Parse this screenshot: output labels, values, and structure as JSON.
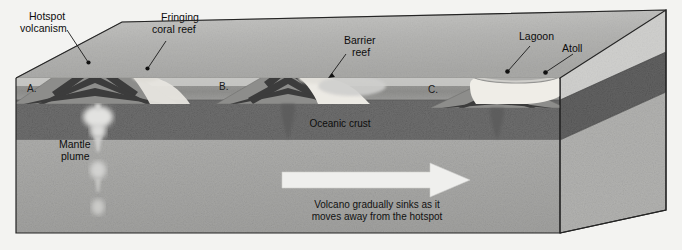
{
  "figure": {
    "kind": "block-diagram"
  },
  "labels": {
    "hotspot_volcanism": "Hotspot\nvolcanism",
    "hotspot_volcanism_l1": "Hotspot",
    "hotspot_volcanism_l2": "volcanism",
    "fringing_reef_l1": "Fringing",
    "fringing_reef_l2": "coral reef",
    "barrier_reef_l1": "Barrier",
    "barrier_reef_l2": "reef",
    "lagoon": "Lagoon",
    "atoll": "Atoll",
    "oceanic_crust": "Oceanic crust",
    "mantle_plume_l1": "Mantle",
    "mantle_plume_l2": "plume",
    "arrow_caption_l1": "Volcano gradually sinks as it",
    "arrow_caption_l2": "moves away from the hotspot"
  },
  "stages": [
    {
      "id": "A",
      "label": "A.",
      "描述": "",
      "description": "Volcanic island with fringing coral reef over the hotspot"
    },
    {
      "id": "B",
      "label": "B.",
      "description": "Subsided volcano with barrier reef and lagoon"
    },
    {
      "id": "C",
      "label": "C.",
      "description": "Fully subsided volcano forming an atoll enclosing a lagoon"
    }
  ],
  "colors": {
    "page_background": "#f3f3f1",
    "sea_water": "#9a9a9a",
    "sea_surface_light": "#d7d7d5",
    "sky_top_face": "#bdbdbb",
    "oceanic_crust": "#6d6d6d",
    "mantle": "#a8a8a6",
    "volcano_dark": "#4a4a4a",
    "volcano_light": "#c9c9c7",
    "reef_light": "#eceae4",
    "plume_light": "#d8d8d6",
    "ash_cloud": "#4d4d4d",
    "arrow_fill": "#efefed",
    "outline": "#2b2b2b"
  },
  "annotations": {
    "arrow_direction": "left-to-right",
    "arrow_meaning": "plate motion away from the hotspot"
  }
}
